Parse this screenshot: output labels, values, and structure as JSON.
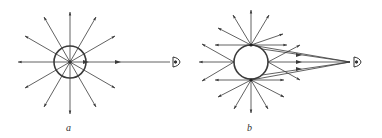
{
  "figure": {
    "panels": [
      {
        "id": "a",
        "label": "a",
        "description": "Rays radiating outward from a point source inside a circle; one horizontal ray travels to an eye",
        "center": [
          70,
          62
        ],
        "circle_radius": 16,
        "ray_length": 46,
        "ray_count": 12,
        "eye_position": [
          176,
          62
        ]
      },
      {
        "id": "b",
        "label": "b",
        "description": "Rays radiating from points on the surface of a sphere; a bundle of rays converges to an eye",
        "center": [
          251,
          62
        ],
        "circle_radius": 17,
        "eye_position": [
          357,
          62
        ]
      }
    ],
    "colors": {
      "line": "#3a3a3a",
      "background": "#ffffff"
    }
  }
}
